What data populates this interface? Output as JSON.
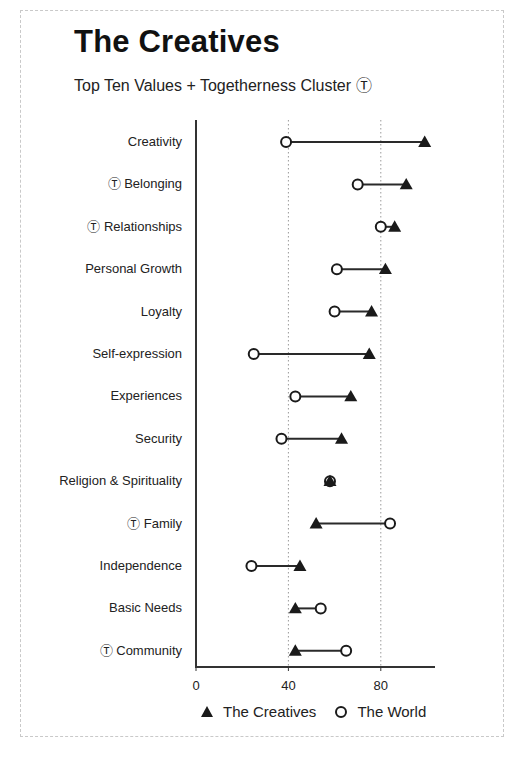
{
  "title": "The Creatives",
  "subtitle": "Top Ten Values + Togetherness Cluster Ⓣ",
  "legend": {
    "creatives_label": "The Creatives",
    "world_label": "The World",
    "creatives_marker": "filled-triangle",
    "world_marker": "open-circle"
  },
  "axis": {
    "ticks": [
      "0",
      "40",
      "80"
    ]
  },
  "rows": [
    {
      "label": "Creativity"
    },
    {
      "label": "Ⓣ Belonging"
    },
    {
      "label": "Ⓣ Relationships"
    },
    {
      "label": "Personal Growth"
    },
    {
      "label": "Loyalty"
    },
    {
      "label": "Self-expression"
    },
    {
      "label": "Experiences"
    },
    {
      "label": "Security"
    },
    {
      "label": "Religion & Spirituality"
    },
    {
      "label": "Ⓣ Family"
    },
    {
      "label": "Independence"
    },
    {
      "label": "Basic Needs"
    },
    {
      "label": "Ⓣ Community"
    }
  ],
  "chart_data": {
    "type": "dumbbell",
    "title": "The Creatives",
    "subtitle": "Top Ten Values + Togetherness Cluster Ⓣ",
    "xlabel": "",
    "ylabel": "",
    "xlim": [
      0,
      103
    ],
    "xticks": [
      0,
      40,
      80
    ],
    "grid": "vertical dotted lines at 40 and 80",
    "legend_position": "bottom",
    "togetherness_cluster_marker": "Ⓣ",
    "categories": [
      "Creativity",
      "Belonging",
      "Relationships",
      "Personal Growth",
      "Loyalty",
      "Self-expression",
      "Experiences",
      "Security",
      "Religion & Spirituality",
      "Family",
      "Independence",
      "Basic Needs",
      "Community"
    ],
    "togetherness_cluster": [
      "Belonging",
      "Relationships",
      "Family",
      "Community"
    ],
    "series": [
      {
        "name": "The Creatives",
        "marker": "filled triangle",
        "values": [
          99,
          91,
          86,
          82,
          76,
          75,
          67,
          63,
          58,
          52,
          45,
          43,
          43
        ]
      },
      {
        "name": "The World",
        "marker": "open circle",
        "values": [
          39,
          70,
          80,
          61,
          60,
          25,
          43,
          37,
          58,
          84,
          24,
          54,
          65
        ]
      }
    ]
  }
}
